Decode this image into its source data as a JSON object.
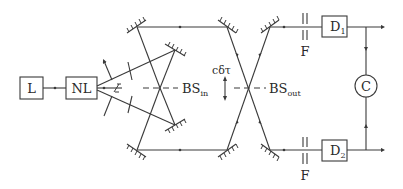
{
  "diagram": {
    "type": "optical-setup-schematic",
    "components": {
      "laser": {
        "label": "L"
      },
      "nonlinear_crystal": {
        "label": "NL"
      },
      "beam_splitter_in": {
        "label": "BS",
        "subscript": "in"
      },
      "beam_splitter_out": {
        "label": "BS",
        "subscript": "out"
      },
      "delay": {
        "label": "cδτ"
      },
      "detector_1": {
        "label": "D",
        "subscript": "1"
      },
      "detector_2": {
        "label": "D",
        "subscript": "2"
      },
      "filter_top": {
        "label": "F"
      },
      "filter_bottom": {
        "label": "F"
      },
      "coincidence": {
        "label": "C"
      }
    },
    "colors": {
      "line": "#3a3a3a",
      "text": "#2a2a2a",
      "background": "#ffffff"
    }
  }
}
